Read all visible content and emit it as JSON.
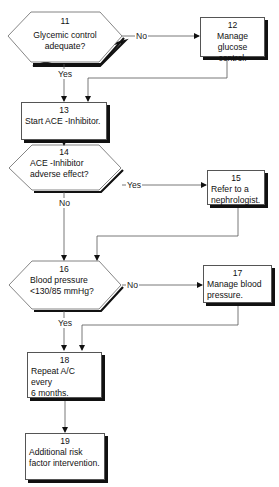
{
  "diagram": {
    "type": "flowchart",
    "nodes": [
      {
        "id": "11",
        "shape": "hexagon",
        "number": "11",
        "line1": "Glycemic control",
        "line2": "adequate?"
      },
      {
        "id": "12",
        "shape": "box",
        "number": "12",
        "line1": "Manage glucose",
        "line2": "control."
      },
      {
        "id": "13",
        "shape": "box",
        "number": "13",
        "line1": "Start ACE -Inhibitor.",
        "line2": ""
      },
      {
        "id": "14",
        "shape": "hexagon",
        "number": "14",
        "line1": "ACE -Inhibitor",
        "line2": "adverse effect?"
      },
      {
        "id": "15",
        "shape": "box",
        "number": "15",
        "line1": "Refer to a",
        "line2": "nephrologist."
      },
      {
        "id": "16",
        "shape": "hexagon",
        "number": "16",
        "line1": "Blood pressure",
        "line2": "<130/85 mmHg?"
      },
      {
        "id": "17",
        "shape": "box",
        "number": "17",
        "line1": "Manage blood",
        "line2": "pressure."
      },
      {
        "id": "18",
        "shape": "box",
        "number": "18",
        "line1": "Repeat A/C every",
        "line2": "6 months."
      },
      {
        "id": "19",
        "shape": "box",
        "number": "19",
        "line1": "Additional risk",
        "line2": "factor intervention."
      }
    ],
    "edges": [
      {
        "from": "11",
        "to": "12",
        "label": "No"
      },
      {
        "from": "11",
        "to": "13",
        "label": "Yes"
      },
      {
        "from": "12",
        "to": "13",
        "label": ""
      },
      {
        "from": "13",
        "to": "14",
        "label": ""
      },
      {
        "from": "14",
        "to": "15",
        "label": "Yes"
      },
      {
        "from": "14",
        "to": "16",
        "label": "No"
      },
      {
        "from": "15",
        "to": "16",
        "label": ""
      },
      {
        "from": "16",
        "to": "17",
        "label": "No"
      },
      {
        "from": "16",
        "to": "18",
        "label": "Yes"
      },
      {
        "from": "17",
        "to": "18",
        "label": ""
      },
      {
        "from": "18",
        "to": "19",
        "label": ""
      }
    ]
  }
}
